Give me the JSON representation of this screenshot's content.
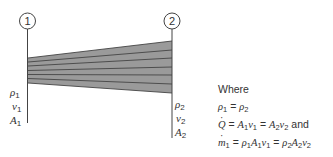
{
  "diagram": {
    "sections": [
      {
        "id": "1",
        "label": "1",
        "rho": "ρ",
        "v": "v",
        "A": "A",
        "sub": "1"
      },
      {
        "id": "2",
        "label": "2",
        "rho": "ρ",
        "v": "v",
        "A": "A",
        "sub": "2"
      }
    ],
    "stream_tube": {
      "fill": "#9a9a9a",
      "line_color": "#444444",
      "streamlines": 6
    },
    "where": {
      "heading": "Where",
      "eq1": {
        "lhs": "ρ",
        "lhs_sub": "1",
        "op": " = ",
        "rhs": "ρ",
        "rhs_sub": "2"
      },
      "eq2": {
        "q": "Q",
        "a1": "A",
        "v1": "v",
        "a2": "A",
        "v2": "v",
        "s1": "1",
        "s2": "2",
        "eq": " = ",
        "tail": " and"
      },
      "eq3": {
        "m": "m",
        "m_sub": "1",
        "rho": "ρ",
        "a": "A",
        "v": "v",
        "s1": "1",
        "s2": "2",
        "eq": " = "
      }
    }
  }
}
